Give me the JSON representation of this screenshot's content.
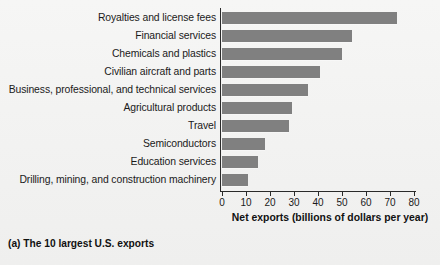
{
  "chart_data": {
    "type": "bar",
    "orientation": "horizontal",
    "title": "",
    "caption": "(a) The 10 largest U.S. exports",
    "xlabel": "Net exports (billions of dollars per year)",
    "ylabel": "",
    "xlim": [
      0,
      82
    ],
    "xticks": [
      0,
      10,
      20,
      30,
      40,
      50,
      60,
      70,
      80
    ],
    "xtick_labels": [
      "0",
      "10",
      "20",
      "30",
      "40",
      "50",
      "60",
      "70",
      "80"
    ],
    "grid": false,
    "legend": false,
    "bar_color": "#808080",
    "categories": [
      "Royalties and license fees",
      "Financial services",
      "Chemicals and plastics",
      "Civilian aircraft and parts",
      "Business, professional, and technical services",
      "Agricultural products",
      "Travel",
      "Semiconductors",
      "Education services",
      "Drilling, mining, and construction machinery"
    ],
    "values": [
      73,
      54,
      50,
      41,
      36,
      29,
      28,
      18,
      15,
      11
    ]
  }
}
